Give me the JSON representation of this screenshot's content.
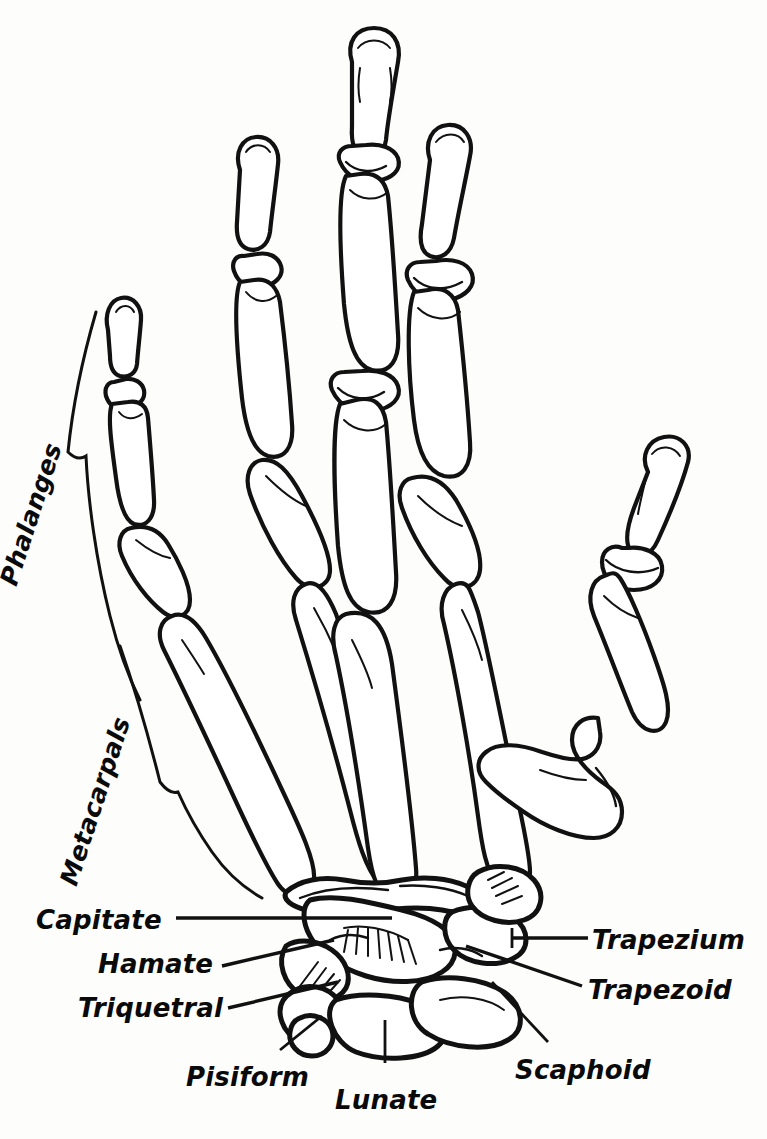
{
  "figure": {
    "style": "black-and-white line drawing",
    "ink_color": "#111111",
    "fill_color": "#ffffff",
    "background_color": "#fdfdfc"
  },
  "group_labels": [
    {
      "id": "phalanges",
      "text": "Phalanges",
      "x": 22,
      "y": 560,
      "rotation": -72,
      "marker": "brace"
    },
    {
      "id": "metacarpals",
      "text": "Metacarpals",
      "x": 82,
      "y": 860,
      "rotation": -72,
      "marker": "brace"
    }
  ],
  "bone_labels": [
    {
      "id": "capitate",
      "text": "Capitate",
      "x": 36,
      "y": 905,
      "align": "left",
      "leader": "horizontal"
    },
    {
      "id": "hamate",
      "text": "Hamate",
      "x": 98,
      "y": 949,
      "align": "left",
      "leader": "diagonal-up"
    },
    {
      "id": "triquetral",
      "text": "Triquetral",
      "x": 78,
      "y": 993,
      "align": "left",
      "leader": "diagonal-up"
    },
    {
      "id": "pisiform",
      "text": "Pisiform",
      "x": 186,
      "y": 1062,
      "align": "left",
      "leader": "diagonal-up"
    },
    {
      "id": "lunate",
      "text": "Lunate",
      "x": 335,
      "y": 1085,
      "align": "left",
      "leader": "vertical"
    },
    {
      "id": "trapezium",
      "text": "Trapezium",
      "x": 592,
      "y": 925,
      "align": "left",
      "leader": "horizontal"
    },
    {
      "id": "trapezoid",
      "text": "Trapezoid",
      "x": 588,
      "y": 975,
      "align": "left",
      "leader": "diagonal-down"
    },
    {
      "id": "scaphoid",
      "text": "Scaphoid",
      "x": 515,
      "y": 1055,
      "align": "left",
      "leader": "diagonal-down"
    }
  ],
  "anatomy": {
    "digits": [
      {
        "name": "thumb",
        "segments": [
          "distal phalanx",
          "proximal phalanx",
          "first metacarpal"
        ]
      },
      {
        "name": "index",
        "segments": [
          "distal phalanx",
          "middle phalanx",
          "proximal phalanx",
          "second metacarpal"
        ]
      },
      {
        "name": "middle",
        "segments": [
          "distal phalanx",
          "middle phalanx",
          "proximal phalanx",
          "third metacarpal"
        ]
      },
      {
        "name": "ring",
        "segments": [
          "distal phalanx",
          "middle phalanx",
          "proximal phalanx",
          "fourth metacarpal"
        ]
      },
      {
        "name": "little",
        "segments": [
          "distal phalanx",
          "middle phalanx",
          "proximal phalanx",
          "fifth metacarpal"
        ]
      }
    ],
    "carpals": [
      "Scaphoid",
      "Lunate",
      "Triquetral",
      "Pisiform",
      "Trapezium",
      "Trapezoid",
      "Capitate",
      "Hamate"
    ]
  }
}
